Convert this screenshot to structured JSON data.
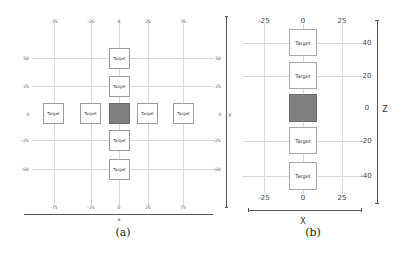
{
  "panel_a": {
    "caption": "(a)",
    "x_axis_label": "x",
    "y_axis_label": "y",
    "x_ticks": [
      "-75",
      "-25",
      "0",
      "25",
      "75"
    ],
    "y_ticks": [
      "50",
      "25",
      "0",
      "-25",
      "-50"
    ],
    "targets": [
      {
        "label": "Target",
        "x": 0,
        "y": 50
      },
      {
        "label": "Target",
        "x": 0,
        "y": 25
      },
      {
        "label": "Target",
        "x": -75,
        "y": 0
      },
      {
        "label": "Target",
        "x": -25,
        "y": 0
      },
      {
        "label": "Target",
        "x": 25,
        "y": 0
      },
      {
        "label": "Target",
        "x": 75,
        "y": 0
      },
      {
        "label": "Target",
        "x": 0,
        "y": -25
      },
      {
        "label": "Target",
        "x": 0,
        "y": -50
      }
    ],
    "agent": {
      "x": 0,
      "y": 0,
      "color": "#808080"
    }
  },
  "panel_b": {
    "caption": "(b)",
    "x_axis_label": "X",
    "z_axis_label": "Z",
    "x_ticks": [
      "-25",
      "0",
      "25"
    ],
    "z_ticks": [
      "40",
      "20",
      "0",
      "-20",
      "-40"
    ],
    "targets": [
      {
        "label": "Target",
        "x": 0,
        "z": 40
      },
      {
        "label": "Target",
        "x": 0,
        "z": 20
      },
      {
        "label": "Target",
        "x": 0,
        "z": -20
      },
      {
        "label": "Target",
        "x": 0,
        "z": -40
      }
    ],
    "agent": {
      "x": 0,
      "z": 0,
      "color": "#808080"
    }
  }
}
